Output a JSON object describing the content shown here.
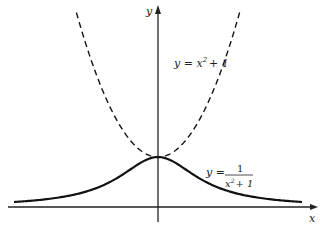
{
  "chart_data": {
    "type": "line",
    "title": "",
    "xlabel": "x",
    "ylabel": "y",
    "xlim": [
      -3.1,
      3.3
    ],
    "ylim": [
      -0.35,
      4.2
    ],
    "grid": false,
    "series": [
      {
        "name": "y = x^2 + 1",
        "style": "dashed",
        "function": "x^2+1",
        "x": [
          -1.7,
          -1.5,
          -1.25,
          -1.0,
          -0.75,
          -0.5,
          -0.25,
          0,
          0.25,
          0.5,
          0.75,
          1.0,
          1.25,
          1.5,
          1.7
        ],
        "values": [
          3.89,
          3.25,
          2.5625,
          2.0,
          1.5625,
          1.25,
          1.0625,
          1.0,
          1.0625,
          1.25,
          1.5625,
          2.0,
          2.5625,
          3.25,
          3.89
        ]
      },
      {
        "name": "y = 1/(x^2 + 1)",
        "style": "solid",
        "function": "1/(x^2+1)",
        "x": [
          -3.0,
          -2.5,
          -2.0,
          -1.5,
          -1.0,
          -0.5,
          0,
          0.5,
          1.0,
          1.5,
          2.0,
          2.5,
          3.0
        ],
        "values": [
          0.1,
          0.138,
          0.2,
          0.308,
          0.5,
          0.8,
          1.0,
          0.8,
          0.5,
          0.308,
          0.2,
          0.138,
          0.1
        ]
      }
    ],
    "annotations": [
      {
        "id": "parabola",
        "lhs": "y = x",
        "exp": "2",
        "rhs": "+ 1"
      },
      {
        "id": "reciprocal",
        "lhs": "y =",
        "numerator": "1",
        "den_base": "x",
        "den_exp": "2",
        "den_rest": "+ 1"
      }
    ]
  }
}
